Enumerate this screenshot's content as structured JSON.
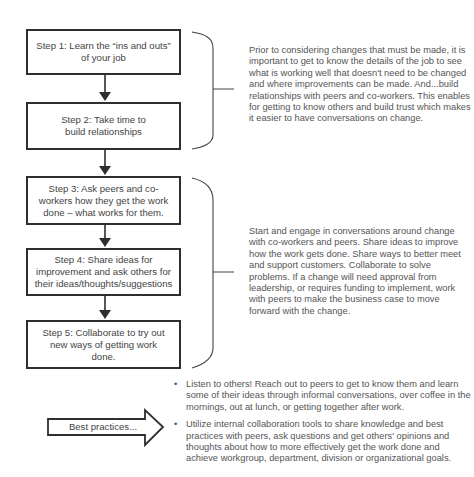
{
  "steps": [
    {
      "id": 1,
      "label": "Step 1: Learn the “ins and outs” of your job"
    },
    {
      "id": 2,
      "label": "Step 2: Take time to build relationships"
    },
    {
      "id": 3,
      "label": "Step 3: Ask peers and co-workers how they get the work done – what works for them."
    },
    {
      "id": 4,
      "label": "Step 4: Share ideas for improvement and ask others for their ideas/thoughts/suggestions"
    },
    {
      "id": 5,
      "label": "Step 5: Collaborate to try out new ways of getting work done."
    }
  ],
  "descriptions": {
    "group1": "Prior to considering changes that must be made, it is important to get to know the details of the job to see what is working well that doesn't need to be changed and where improvements can be made. And...build relationships with peers and co-workers. This enables for getting to know others and build trust which makes it easier to have conversations on change.",
    "group2": "Start and engage in conversations around change with co-workers and peers. Share ideas to improve how the work gets done. Share ways to better meet and support customers. Collaborate to solve problems. If a change will need approval from leadership, or requires funding to implement, work with peers to make the business case to move forward with the change."
  },
  "best_practices": {
    "label": "Best practices...",
    "bullet_glyph": "•",
    "items": [
      "Listen to others! Reach out to peers to get to know them and learn some of their ideas through informal conversations, over coffee in the mornings, out at lunch, or getting together after work.",
      "Utilize internal collaboration tools to share knowledge and best practices with peers, ask questions and get others' opinions and thoughts about how to more effectively get the work done and achieve workgroup, department, division or organizational goals."
    ]
  },
  "colors": {
    "stroke": "#2e2e2e",
    "text": "#444444",
    "body_text": "#555555"
  }
}
